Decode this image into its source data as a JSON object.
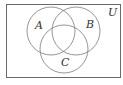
{
  "diagram": {
    "type": "venn",
    "universe": {
      "label": "U",
      "rect": {
        "x": 6,
        "y": 4,
        "width": 114,
        "height": 73
      },
      "label_pos": {
        "x": 108,
        "y": 16
      }
    },
    "sets": [
      {
        "label": "A",
        "cx": 51,
        "cy": 31,
        "r": 24,
        "label_pos": {
          "x": 35,
          "y": 29
        }
      },
      {
        "label": "B",
        "cx": 76,
        "cy": 31,
        "r": 24,
        "label_pos": {
          "x": 86,
          "y": 28
        }
      },
      {
        "label": "C",
        "cx": 64,
        "cy": 49,
        "r": 24,
        "label_pos": {
          "x": 61,
          "y": 66
        }
      }
    ],
    "colors": {
      "stroke": "#7a7a7a",
      "border": "#6a6a6a",
      "label": "#333333",
      "background": "#ffffff"
    }
  }
}
